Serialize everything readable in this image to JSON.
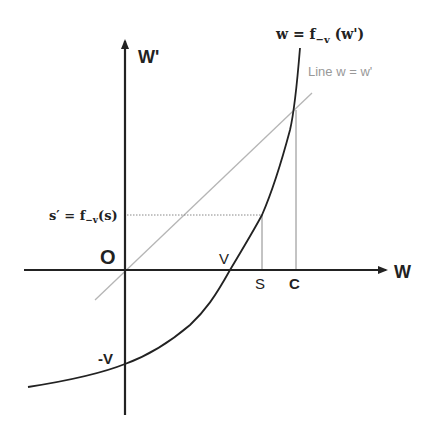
{
  "diagram": {
    "type": "function-plot",
    "axes": {
      "x_label": "W",
      "y_label": "W'",
      "origin_label": "O"
    },
    "curve": {
      "label": "w = f−v (w')",
      "label_main": "w = f",
      "label_sub": "−v",
      "label_tail": " (w')",
      "color": "#222222"
    },
    "line": {
      "label": "Line w = w'",
      "color": "#aaaaaa"
    },
    "points": {
      "v_label": "V",
      "neg_v_label": "-V",
      "s_label": "S",
      "c_label": "C"
    },
    "s_prime": {
      "label": "s' = f−v(s)",
      "label_main": "s′ = f",
      "label_sub": "−v",
      "label_tail": "(s)"
    }
  }
}
